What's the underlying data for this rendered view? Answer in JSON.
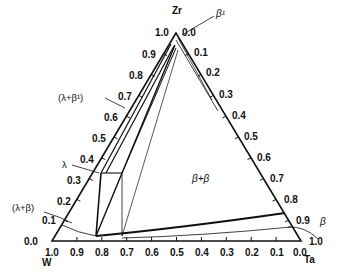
{
  "diagram": {
    "type": "ternary-phase-diagram",
    "vertices": {
      "top": {
        "element": "Zr"
      },
      "bottom_left": {
        "element": "W"
      },
      "bottom_right": {
        "element": "Ta"
      }
    },
    "left_axis_ticks": [
      "0.0",
      "0.1",
      "0.2",
      "0.3",
      "0.4",
      "0.5",
      "0.6",
      "0.7",
      "0.8",
      "0.9",
      "1.0"
    ],
    "right_axis_ticks": [
      "0.0",
      "0.1",
      "0.2",
      "0.3",
      "0.4",
      "0.5",
      "0.6",
      "0.7",
      "0.8",
      "0.9",
      "1.0"
    ],
    "bottom_axis_ticks": [
      "1.0",
      "0.9",
      "0.8",
      "0.7",
      "0.6",
      "0.5",
      "0.4",
      "0.3",
      "0.2",
      "0.1",
      "0.0"
    ],
    "phase_labels": {
      "beta_prime": "β¹",
      "lambda_beta_prime": "(λ+β¹)",
      "lambda": "λ",
      "lambda_beta": "(λ+β)",
      "beta_beta": "β+β",
      "beta": "β"
    }
  }
}
